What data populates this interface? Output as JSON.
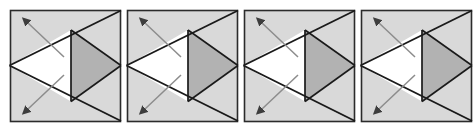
{
  "figure": {
    "title": "",
    "type": "geometric-diagram-sequence",
    "panel_count": 4,
    "background_color": "#ffffff"
  },
  "colors": {
    "panel_background": "#d9d9d9",
    "white_triangle": "#ffffff",
    "shaded_triangle": "#b2b2b2",
    "stroke": "#1a1a1a",
    "arrow_shaft": "#8c8c8c",
    "arrow_head": "#3d3d3d",
    "panel_border": "#2b2b2b"
  },
  "geometry": {
    "viewbox": "0 0 113 114",
    "panel_border_rect": {
      "x": 1.5,
      "y": 1.5,
      "w": 110,
      "h": 111
    },
    "white_triangle_points": "0.5,56.5 62,21 62,92.5",
    "shaded_triangle_points": "62,21 112,56.5 62,92.5",
    "upper_diagonal": {
      "x1": 0.5,
      "y1": 56.5,
      "x2": 112,
      "y2": 1.5
    },
    "lower_diagonal": {
      "x1": 0.5,
      "y1": 56.5,
      "x2": 112,
      "y2": 112
    },
    "vertical_divider": {
      "x1": 62,
      "y1": 21,
      "x2": 62,
      "y2": 92.5
    },
    "arrow_upper": {
      "x1": 55,
      "y1": 48,
      "x2": 19,
      "y2": 14
    },
    "arrow_lower": {
      "x1": 55,
      "y1": 66,
      "x2": 19,
      "y2": 100
    }
  },
  "panels": [
    {
      "index": 1,
      "label": "panel-1"
    },
    {
      "index": 2,
      "label": "panel-2"
    },
    {
      "index": 3,
      "label": "panel-3"
    },
    {
      "index": 4,
      "label": "panel-4"
    }
  ],
  "annotations": {
    "arrow_count_per_panel": 2,
    "arrow_style": "double-headed",
    "arrow_upper_name": "upper-normal-arrow",
    "arrow_lower_name": "lower-normal-arrow"
  }
}
